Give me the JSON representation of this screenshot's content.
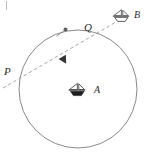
{
  "figure": {
    "background_color": "#ffffff",
    "stroke_color": "#6b6b6b",
    "dash_color": "#8a8a8a",
    "label_color": "#2b2b2b",
    "width": 151,
    "height": 160
  },
  "labels": {
    "point_p": "P",
    "point_q": "Q",
    "boat_a": "A",
    "boat_b": "B"
  },
  "geometry": {
    "circle": {
      "cx": 78,
      "cy": 89,
      "r": 59
    },
    "point_p": {
      "x": 20,
      "y": 77
    },
    "point_q": {
      "x": 90,
      "y": 31
    },
    "boat_a": {
      "x": 78,
      "y": 91
    },
    "boat_b": {
      "x": 122,
      "y": 17
    },
    "dashed_line": {
      "x1": 3,
      "y1": 88,
      "x2": 114,
      "y2": 23
    },
    "direction_arrow_on_line": {
      "x": 64,
      "y": 60
    },
    "arc_marker": {
      "x": 65,
      "y": 29
    }
  },
  "icons": {
    "boat_a_icon": "sailboat-filled-icon",
    "boat_b_icon": "sailboat-outline-icon",
    "arrow_icon": "arrowhead-icon",
    "arc_dot_icon": "arc-marker-dot-icon"
  }
}
